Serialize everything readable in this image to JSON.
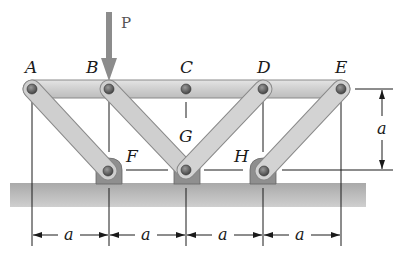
{
  "figure": {
    "load": {
      "label": "P",
      "color": "#8c8c8c"
    },
    "joints": {
      "A": "A",
      "B": "B",
      "C": "C",
      "D": "D",
      "E": "E",
      "F": "F",
      "G": "G",
      "H": "H"
    },
    "dimensions": {
      "horizontal": [
        "a",
        "a",
        "a",
        "a"
      ],
      "vertical": "a"
    },
    "colors": {
      "member": "#c9c9c9",
      "member_edge": "#8a8a8a",
      "pin": "#5a5a5a",
      "ground": "#b5b5b5",
      "support": "#8f8f8f"
    }
  }
}
